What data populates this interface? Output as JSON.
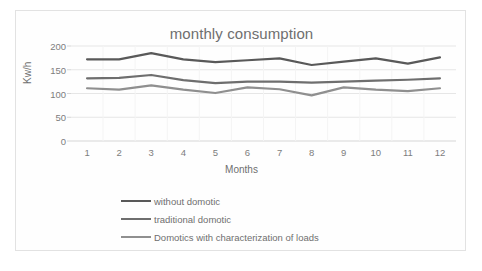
{
  "chart_data": {
    "type": "line",
    "title": "monthly consumption",
    "xlabel": "Months",
    "ylabel": "Kw/h",
    "categories": [
      "1",
      "2",
      "3",
      "4",
      "5",
      "6",
      "7",
      "8",
      "9",
      "10",
      "11",
      "12"
    ],
    "ylim": [
      0,
      200
    ],
    "yticks": [
      "0",
      "50",
      "100",
      "150",
      "200"
    ],
    "grid": true,
    "legend_position": "bottom-left",
    "series": [
      {
        "name": "without domotic",
        "color": "#595959",
        "values": [
          172,
          172,
          185,
          172,
          166,
          170,
          174,
          160,
          167,
          174,
          163,
          176
        ]
      },
      {
        "name": "traditional domotic",
        "color": "#6e6e6e",
        "values": [
          132,
          133,
          139,
          128,
          122,
          125,
          125,
          123,
          125,
          127,
          129,
          132
        ]
      },
      {
        "name": "Domotics with characterization of loads",
        "color": "#8f8f8f",
        "values": [
          111,
          108,
          117,
          108,
          101,
          113,
          109,
          96,
          113,
          108,
          105,
          111
        ]
      }
    ],
    "axis_color": "#d6d6d6",
    "grid_color": "#e6e6e6",
    "text_color": "#6f6f6f",
    "background": "#ffffff"
  }
}
